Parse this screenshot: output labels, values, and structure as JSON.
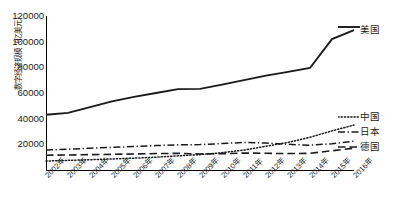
{
  "chart_data": {
    "type": "line",
    "title": "",
    "xlabel": "",
    "ylabel": "数字经济规模（亿美元）",
    "ylim": [
      0,
      120000
    ],
    "ytick_step": 20000,
    "grid": false,
    "legend_position": "right-inline",
    "categories": [
      "2002年",
      "2003年",
      "2004年",
      "2005年",
      "2006年",
      "2007年",
      "2008年",
      "2009年",
      "2010年",
      "2011年",
      "2012年",
      "2013年",
      "2014年",
      "2015年",
      "2016年"
    ],
    "series": [
      {
        "name": "美国",
        "style": "solid",
        "values": [
          43000,
          44500,
          49000,
          53500,
          57000,
          60000,
          63000,
          63200,
          66500,
          70000,
          73500,
          76500,
          79500,
          102000,
          109000
        ]
      },
      {
        "name": "中国",
        "style": "dotted",
        "values": [
          7000,
          7500,
          8000,
          8600,
          9200,
          10000,
          11000,
          12000,
          13500,
          15500,
          18500,
          21500,
          25500,
          30500,
          35000
        ]
      },
      {
        "name": "日本",
        "style": "dash-dot",
        "values": [
          15500,
          16200,
          17000,
          17600,
          18300,
          19000,
          19600,
          19800,
          20600,
          21500,
          21000,
          20000,
          19300,
          20500,
          22500
        ]
      },
      {
        "name": "德国",
        "style": "long-dash",
        "values": [
          11500,
          11700,
          12000,
          12200,
          12500,
          12800,
          13000,
          12500,
          12700,
          13200,
          13000,
          12800,
          13000,
          15000,
          17000
        ]
      }
    ],
    "yticks": [
      "120000",
      "100000",
      "80000",
      "60000",
      "40000",
      "20000"
    ]
  },
  "axis": {
    "y_label": "数字经济规模（亿美元）"
  },
  "legend": {
    "us": "美国",
    "cn": "中国",
    "jp": "日本",
    "de": "德国"
  }
}
